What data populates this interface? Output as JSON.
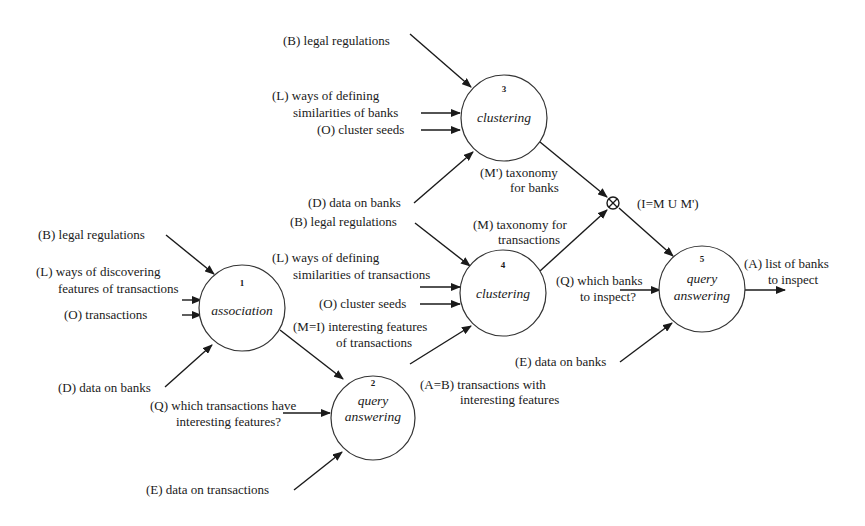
{
  "diagram": {
    "colors": {
      "ink": "#1a1a1a",
      "node_stroke": "#333333",
      "background": "#ffffff"
    },
    "nodes": [
      {
        "id": "1",
        "number": "1",
        "label_lines": [
          "association"
        ]
      },
      {
        "id": "2",
        "number": "2",
        "label_lines": [
          "query",
          "answering"
        ]
      },
      {
        "id": "3",
        "number": "3",
        "label_lines": [
          "clustering"
        ]
      },
      {
        "id": "4",
        "number": "4",
        "label_lines": [
          "clustering"
        ]
      },
      {
        "id": "5",
        "number": "5",
        "label_lines": [
          "query",
          "answering"
        ]
      }
    ],
    "junction": {
      "symbol": "⊗",
      "label": "(I=M U M')"
    },
    "labels": {
      "n3_b": "(B) legal regulations",
      "n3_l1": "(L) ways of defining",
      "n3_l2": "similarities of banks",
      "n3_o": "(O) cluster seeds",
      "n3_d": "(D) data on banks",
      "n3_out1": "(M') taxonomy",
      "n3_out2": "for banks",
      "n4_b": "(B) legal regulations",
      "n4_l1": "(L) ways of defining",
      "n4_l2": "similarities of transactions",
      "n4_o": "(O) cluster seeds",
      "n4_out1": "(M) taxonomy for",
      "n4_out2": "transactions",
      "n1_b": "(B) legal regulations",
      "n1_l1": "(L) ways of discovering",
      "n1_l2": "features of transactions",
      "n1_o": "(O) transactions",
      "n1_d": "(D) data on banks",
      "n1_out1": "(M=I) interesting features",
      "n1_out2": "of transactions",
      "n2_q1": "(Q) which transactions have",
      "n2_q2": "interesting features?",
      "n2_e": "(E) data on transactions",
      "n2_out1": "(A=B) transactions with",
      "n2_out2": "interesting features",
      "n5_q1": "(Q) which banks",
      "n5_q2": "to inspect?",
      "n5_e": "(E) data on banks",
      "n5_out1": "(A) list of banks",
      "n5_out2": "to inspect"
    }
  }
}
